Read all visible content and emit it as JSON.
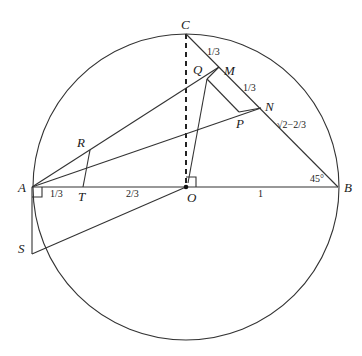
{
  "diagram": {
    "type": "geometry",
    "points": {
      "A": {
        "label": "A",
        "x": 32,
        "y": 187
      },
      "B": {
        "label": "B",
        "x": 338,
        "y": 187
      },
      "C": {
        "label": "C",
        "x": 186,
        "y": 34
      },
      "O": {
        "label": "O",
        "x": 186,
        "y": 187
      },
      "M": {
        "label": "M",
        "x": 219,
        "y": 67
      },
      "N": {
        "label": "N",
        "x": 261,
        "y": 108
      },
      "Q": {
        "label": "Q",
        "x": 207,
        "y": 79
      },
      "P": {
        "label": "P",
        "x": 239,
        "y": 112
      },
      "R": {
        "label": "R",
        "x": 90,
        "y": 150
      },
      "T": {
        "label": "T",
        "x": 83,
        "y": 187
      },
      "S": {
        "label": "S",
        "x": 32,
        "y": 254
      }
    },
    "segment_labels": {
      "CM": "1/3",
      "MN": "1/3",
      "NB": "√2−2/3",
      "AT": "1/3",
      "TO": "2/3",
      "OB": "1",
      "angle_B": "45°"
    },
    "colors": {
      "stroke": "#333333",
      "text": "#1a1a1a",
      "background": "#ffffff"
    }
  }
}
